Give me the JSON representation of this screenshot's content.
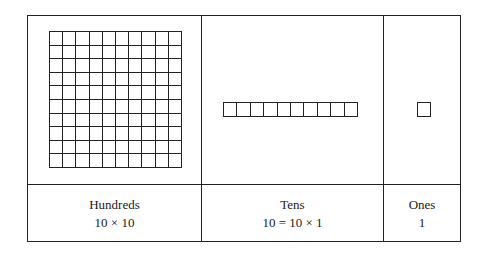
{
  "diagram": {
    "columns": [
      {
        "label": "Hundreds",
        "formula": "10 × 10",
        "block": {
          "type": "square-grid",
          "rows": 10,
          "cols": 10
        }
      },
      {
        "label": "Tens",
        "formula": "10 = 10 × 1",
        "block": {
          "type": "rod",
          "rows": 1,
          "cols": 10
        }
      },
      {
        "label": "Ones",
        "formula": "1",
        "block": {
          "type": "unit",
          "rows": 1,
          "cols": 1
        }
      }
    ],
    "line_color": "#222222",
    "background_color": "#ffffff"
  }
}
